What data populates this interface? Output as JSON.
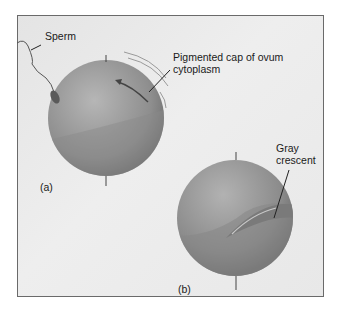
{
  "figure": {
    "panels": [
      {
        "id": "a",
        "label": "(a)",
        "callouts": [
          {
            "text": "Sperm"
          },
          {
            "text_line1": "Pigmented cap of ovum",
            "text_line2": "cytoplasm"
          }
        ]
      },
      {
        "id": "b",
        "label": "(b)",
        "callouts": [
          {
            "text_line1": "Gray",
            "text_line2": "crescent"
          }
        ]
      }
    ],
    "colors": {
      "background": "#e8e8e8",
      "sphere_light": "#a9a9a9",
      "sphere_dark": "#6e6e6e",
      "border": "#6a6a6a",
      "text": "#1a1a1a"
    }
  }
}
